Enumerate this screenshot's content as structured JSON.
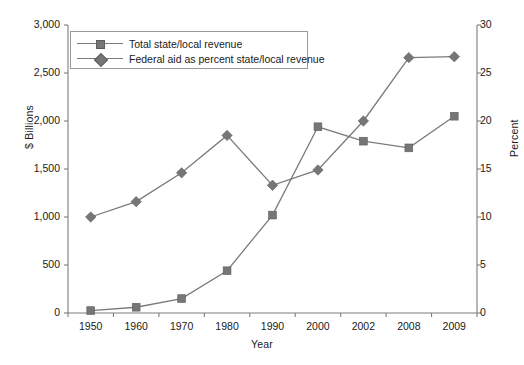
{
  "chart_data": {
    "type": "line",
    "title": "",
    "xlabel": "Year",
    "ylabel": "$ Billions",
    "y2label": "Percent",
    "categories": [
      "1950",
      "1960",
      "1970",
      "1980",
      "1990",
      "2000",
      "2002",
      "2008",
      "2009"
    ],
    "ylim": [
      0,
      3000
    ],
    "yticks": [
      "0",
      "500",
      "1,000",
      "1,500",
      "2,000",
      "2,500",
      "3,000"
    ],
    "ytick_values": [
      0,
      500,
      1000,
      1500,
      2000,
      2500,
      3000
    ],
    "y2lim": [
      0,
      30
    ],
    "y2ticks": [
      "0",
      "5",
      "10",
      "15",
      "20",
      "25",
      "30"
    ],
    "y2tick_values": [
      0,
      5,
      10,
      15,
      20,
      25,
      30
    ],
    "grid": false,
    "legend_position": "top-left",
    "series": [
      {
        "name": "Total state/local revenue",
        "axis": "left",
        "marker": "square",
        "color": "#767676",
        "values": [
          25,
          60,
          150,
          440,
          1020,
          1940,
          1790,
          1720,
          2050
        ]
      },
      {
        "name": "Federal aid as percent state/local revenue",
        "axis": "right",
        "marker": "diamond",
        "color": "#767676",
        "values": [
          10.0,
          11.6,
          14.6,
          18.5,
          13.3,
          14.9,
          20.0,
          26.6,
          26.7
        ]
      }
    ]
  }
}
